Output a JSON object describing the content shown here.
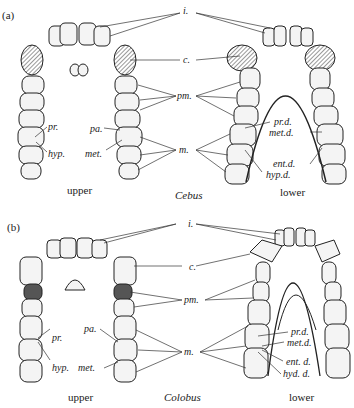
{
  "panels": [
    {
      "id": "a",
      "panel_label": "(a)",
      "genus": "Cebus",
      "upper_caption": "upper",
      "lower_caption": "lower",
      "center_labels": {
        "incisors": "i.",
        "canine": "c.",
        "premolars": "pm.",
        "molars": "m."
      },
      "upper_cusp_labels": {
        "protocone": "pr.",
        "hypocone": "hyp.",
        "paracone": "pa.",
        "metacone": "met."
      },
      "lower_cusp_labels": {
        "protoconid": "pr.d.",
        "metaconid": "met.d.",
        "entoconid": "ent.d.",
        "hypoconid": "hyp.d."
      }
    },
    {
      "id": "b",
      "panel_label": "(b)",
      "genus": "Colobus",
      "upper_caption": "upper",
      "lower_caption": "lower",
      "center_labels": {
        "incisors": "i.",
        "canine": "c.",
        "premolars": "pm.",
        "molars": "m."
      },
      "upper_cusp_labels": {
        "protocone": "pr.",
        "hypocone": "hyp.",
        "paracone": "pa.",
        "metacone": "met."
      },
      "lower_cusp_labels": {
        "protoconid": "pr.d.",
        "metaconid": "met.d.",
        "entoconid": "ent. d.",
        "hypoconulid": "hyd. d."
      }
    }
  ],
  "colors": {
    "ink": "#222222",
    "tooth_fill": "#f4f4f4",
    "shade": "#555555",
    "background": "#ffffff"
  }
}
